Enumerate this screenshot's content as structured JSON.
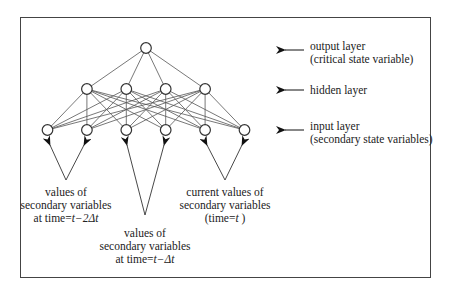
{
  "diagram": {
    "layers": {
      "output": {
        "label_line1": "output layer",
        "label_line2": "(critical state variable)",
        "node_count": 1
      },
      "hidden": {
        "label_line1": "hidden layer",
        "node_count": 4
      },
      "input": {
        "label_line1": "input layer",
        "label_line2": "(secondary state variables)",
        "node_count": 6
      }
    },
    "groups": [
      {
        "line1": "values of",
        "line2": "secondary variables",
        "line3_prefix": "at time=",
        "line3_var": "t−2Δt"
      },
      {
        "line1": "values of",
        "line2": "secondary variables",
        "line3_prefix": "at time=",
        "line3_var": "t−Δt"
      },
      {
        "line1": "current values of",
        "line2": "secondary variables",
        "line3_prefix": "(time=",
        "line3_var": "t",
        "line3_suffix": " )"
      }
    ],
    "colors": {
      "line": "#555555",
      "node_stroke": "#333333",
      "frame": "#444444",
      "arrow": "#111111"
    }
  }
}
